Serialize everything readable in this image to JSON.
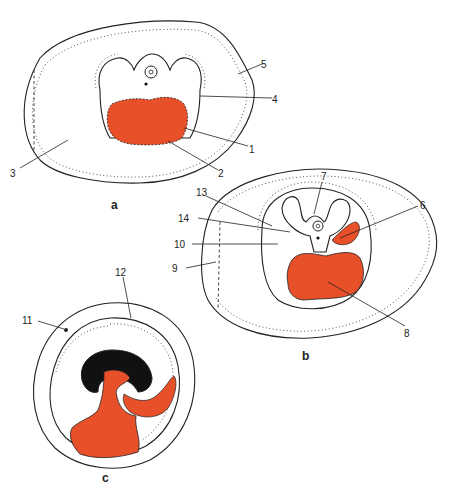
{
  "figure": {
    "colors": {
      "blood": "#E8502A",
      "tissue_fill": "#ffffff",
      "stipple": "#555555",
      "outline": "#222222",
      "dark_mass": "#111111"
    },
    "panels": [
      {
        "id": "a",
        "label": "a"
      },
      {
        "id": "b",
        "label": "b"
      },
      {
        "id": "c",
        "label": "c"
      }
    ],
    "callouts": [
      {
        "number": "1"
      },
      {
        "number": "2"
      },
      {
        "number": "3"
      },
      {
        "number": "4"
      },
      {
        "number": "5"
      },
      {
        "number": "6"
      },
      {
        "number": "7"
      },
      {
        "number": "8"
      },
      {
        "number": "9"
      },
      {
        "number": "10"
      },
      {
        "number": "11"
      },
      {
        "number": "12"
      },
      {
        "number": "13"
      },
      {
        "number": "14"
      }
    ]
  }
}
